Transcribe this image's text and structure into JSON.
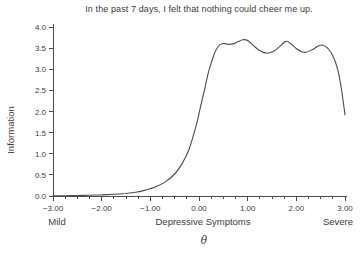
{
  "chart_data": {
    "type": "line",
    "title": "In the past 7 days, I felt that nothing could cheer me up.",
    "ylabel": "Information",
    "xlabel": "θ",
    "x_region_labels": {
      "left": "Mild",
      "center": "Depressive Symptoms",
      "right": "Severe"
    },
    "xlim": [
      -3,
      3
    ],
    "ylim": [
      0,
      4
    ],
    "grid": false,
    "legend": "none",
    "x_minor_step": 0.25,
    "x_ticks": [
      {
        "value": -3,
        "label": "−3.00"
      },
      {
        "value": -2,
        "label": "−2.00"
      },
      {
        "value": -1,
        "label": "−1.00"
      },
      {
        "value": 0,
        "label": "0.00"
      },
      {
        "value": 1,
        "label": "1.00"
      },
      {
        "value": 2,
        "label": "2.00"
      },
      {
        "value": 3,
        "label": "3.00"
      }
    ],
    "y_ticks": [
      {
        "value": 0.0,
        "label": "0.0"
      },
      {
        "value": 0.5,
        "label": "0.5"
      },
      {
        "value": 1.0,
        "label": "1.0"
      },
      {
        "value": 1.5,
        "label": "1.5"
      },
      {
        "value": 2.0,
        "label": "2.0"
      },
      {
        "value": 2.5,
        "label": "2.5"
      },
      {
        "value": 3.0,
        "label": "3.0"
      },
      {
        "value": 3.5,
        "label": "3.5"
      },
      {
        "value": 4.0,
        "label": "4.0"
      }
    ],
    "series": [
      {
        "name": "item-information-curve",
        "color": "#4d4d4d",
        "points": [
          [
            -3.0,
            0.005
          ],
          [
            -2.75,
            0.008
          ],
          [
            -2.5,
            0.012
          ],
          [
            -2.25,
            0.018
          ],
          [
            -2.0,
            0.027
          ],
          [
            -1.75,
            0.04
          ],
          [
            -1.5,
            0.06
          ],
          [
            -1.3,
            0.09
          ],
          [
            -1.1,
            0.14
          ],
          [
            -0.9,
            0.21
          ],
          [
            -0.7,
            0.33
          ],
          [
            -0.5,
            0.52
          ],
          [
            -0.35,
            0.76
          ],
          [
            -0.2,
            1.12
          ],
          [
            -0.05,
            1.7
          ],
          [
            0.0,
            1.95
          ],
          [
            0.1,
            2.45
          ],
          [
            0.2,
            2.95
          ],
          [
            0.3,
            3.32
          ],
          [
            0.4,
            3.55
          ],
          [
            0.5,
            3.61
          ],
          [
            0.6,
            3.59
          ],
          [
            0.7,
            3.6
          ],
          [
            0.8,
            3.65
          ],
          [
            0.9,
            3.7
          ],
          [
            1.0,
            3.68
          ],
          [
            1.12,
            3.56
          ],
          [
            1.25,
            3.44
          ],
          [
            1.4,
            3.38
          ],
          [
            1.55,
            3.44
          ],
          [
            1.65,
            3.53
          ],
          [
            1.78,
            3.66
          ],
          [
            1.88,
            3.61
          ],
          [
            2.0,
            3.49
          ],
          [
            2.1,
            3.42
          ],
          [
            2.2,
            3.4
          ],
          [
            2.32,
            3.46
          ],
          [
            2.45,
            3.55
          ],
          [
            2.55,
            3.57
          ],
          [
            2.65,
            3.49
          ],
          [
            2.75,
            3.32
          ],
          [
            2.85,
            3.0
          ],
          [
            2.92,
            2.58
          ],
          [
            2.97,
            2.18
          ],
          [
            3.0,
            1.92
          ]
        ]
      }
    ],
    "colors": {
      "axis": "#4d4d4d",
      "text": "#3b3b3b"
    }
  }
}
